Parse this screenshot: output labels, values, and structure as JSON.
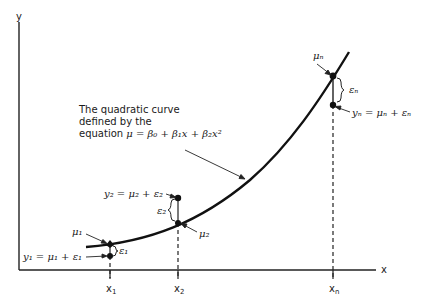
{
  "figure": {
    "axes": {
      "x_label": "x",
      "y_label": "y"
    },
    "x_ticks": [
      {
        "id": "x1",
        "label": "x",
        "sub": "1"
      },
      {
        "id": "x2",
        "label": "x",
        "sub": "2"
      },
      {
        "id": "xn",
        "label": "x",
        "sub": "n"
      }
    ],
    "caption": {
      "line1": "The quadratic curve",
      "line2": "defined by the",
      "line3_prefix": "equation ",
      "equation": "μ = β₀ + β₁x + β₂x²"
    },
    "points": {
      "mu1": "μ₁",
      "y1": "y₁ = μ₁ + ε₁",
      "eps1": "ε₁",
      "mu2": "μ₂",
      "y2": "y₂ = μ₂ + ε₂",
      "eps2": "ε₂",
      "mun": "μₙ",
      "yn": "yₙ = μₙ + εₙ",
      "epsn": "εₙ"
    }
  }
}
